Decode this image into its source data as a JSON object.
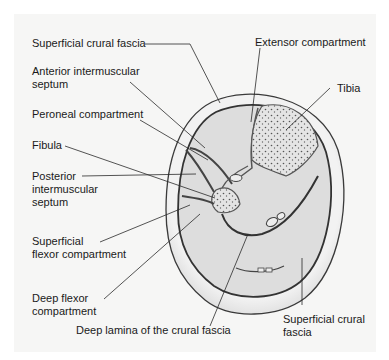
{
  "diagram": {
    "labels": {
      "superficial_crural_fascia_top": "Superficial crural fascia",
      "anterior_intermuscular_septum_l1": "Anterior intermuscular",
      "anterior_intermuscular_septum_l2": "septum",
      "peroneal_compartment": "Peroneal compartment",
      "fibula": "Fibula",
      "posterior_intermuscular_septum_l1": "Posterior",
      "posterior_intermuscular_septum_l2": "intermuscular",
      "posterior_intermuscular_septum_l3": "septum",
      "superficial_flexor_compartment_l1": "Superficial",
      "superficial_flexor_compartment_l2": "flexor compartment",
      "deep_flexor_compartment_l1": "Deep flexor",
      "deep_flexor_compartment_l2": "compartment",
      "deep_lamina": "Deep lamina of the crural fascia",
      "extensor_compartment": "Extensor compartment",
      "tibia": "Tibia",
      "superficial_crural_fascia_bottom_l1": "Superficial crural",
      "superficial_crural_fascia_bottom_l2": "fascia"
    },
    "colors": {
      "background": "#f6f6f5",
      "outer_skin": "#efefef",
      "muscle": "#dcdcdc",
      "outline": "#3a3a3a",
      "leader_line": "#2a2a2a",
      "bone": "#e2e2e2"
    }
  }
}
